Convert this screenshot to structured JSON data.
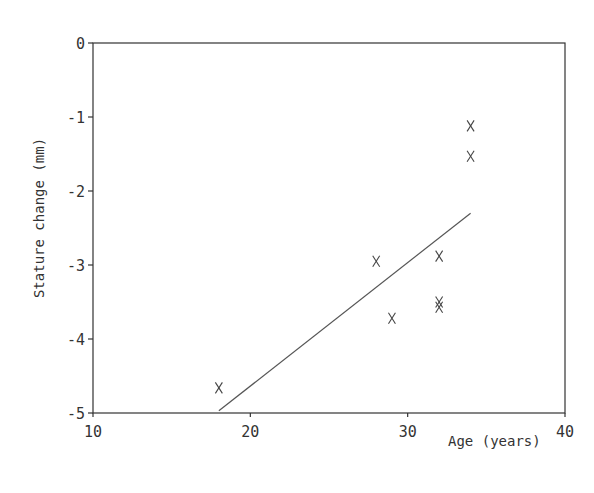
{
  "chart_data": {
    "type": "scatter",
    "title": "",
    "xlabel": "Age (years)",
    "ylabel": "Stature change (mm)",
    "xlim": [
      10,
      40
    ],
    "ylim": [
      -5,
      0
    ],
    "x_ticks": [
      10,
      20,
      30,
      40
    ],
    "y_ticks": [
      0,
      -1,
      -2,
      -3,
      -4,
      -5
    ],
    "grid": false,
    "legend": null,
    "marker": "x",
    "series": [
      {
        "name": "observations",
        "points": [
          {
            "x": 18,
            "y": -4.66
          },
          {
            "x": 28,
            "y": -2.95
          },
          {
            "x": 29,
            "y": -3.72
          },
          {
            "x": 32,
            "y": -2.88
          },
          {
            "x": 32,
            "y": -3.5
          },
          {
            "x": 32,
            "y": -3.57
          },
          {
            "x": 34,
            "y": -1.12
          },
          {
            "x": 34,
            "y": -1.53
          }
        ]
      }
    ],
    "regression_line": {
      "x1": 18,
      "y1": -4.97,
      "x2": 34,
      "y2": -2.3
    }
  },
  "axes": {
    "x_title": "Age (years)",
    "y_title": "Stature change (mm)",
    "x_tick_labels": [
      "10",
      "20",
      "30",
      "40"
    ],
    "y_tick_labels": [
      "0",
      "-1",
      "-2",
      "-3",
      "-4",
      "-5"
    ]
  }
}
